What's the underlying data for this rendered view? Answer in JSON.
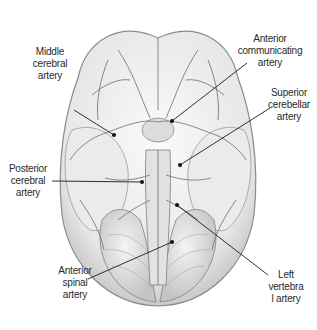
{
  "figure": {
    "background": "#ffffff",
    "line_color": "#1a1a1a",
    "labels": [
      {
        "id": "middle-cerebral-artery",
        "text": "Middle\ncerebral\nartery",
        "x": 27,
        "y": 46,
        "w": 46
      },
      {
        "id": "anterior-communicating-artery",
        "text": "Anterior\ncommunicating\nartery",
        "x": 234,
        "y": 33,
        "w": 72
      },
      {
        "id": "superior-cerebellar-artery",
        "text": "Superior\ncerebellar\nartery",
        "x": 264,
        "y": 87,
        "w": 50
      },
      {
        "id": "posterior-cerebral-artery",
        "text": "Posterior\ncerebral\nartery",
        "x": 4,
        "y": 163,
        "w": 48
      },
      {
        "id": "anterior-spinal-artery",
        "text": "Anterior\nspinal\nartery",
        "x": 53,
        "y": 265,
        "w": 44
      },
      {
        "id": "left-vertebral-artery",
        "text": "Left\nvertebra\nl artery",
        "x": 264,
        "y": 269,
        "w": 44
      }
    ]
  }
}
